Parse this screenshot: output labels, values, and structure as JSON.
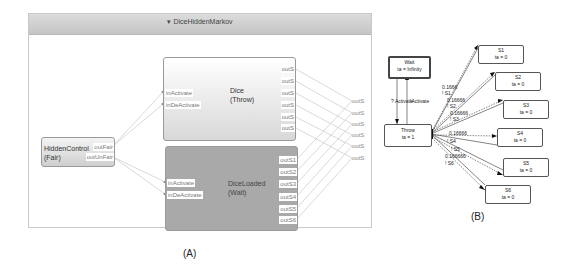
{
  "panel_a": {
    "caption": "(A)",
    "frame": {
      "title": "▾ DiceHiddenMarkov"
    },
    "blocks": {
      "dice": {
        "name": "Dice",
        "subtitle": "(Throw)",
        "inputs": [
          "inActivate",
          "inDeActivate"
        ],
        "outputs": [
          "outS",
          "outS",
          "outS",
          "outS",
          "outS",
          "outS"
        ]
      },
      "dice_loaded": {
        "name": "DiceLoaded",
        "subtitle": "(Wait)",
        "inputs": [
          "inActivate",
          "inDeActivate"
        ],
        "outputs": [
          "outS1",
          "outS2",
          "outS3",
          "outS4",
          "outS5",
          "outS6"
        ]
      },
      "hidden_control": {
        "name": "HiddenControl",
        "subtitle": "(Fair)",
        "outputs": [
          "outFair",
          "outUnFair"
        ]
      }
    },
    "external_outputs": [
      "outS",
      "outS",
      "outS",
      "outS",
      "outS",
      "outS"
    ]
  },
  "panel_b": {
    "caption": "(B)",
    "states": {
      "wait": {
        "name": "Wait",
        "ta": "ta = Infinity"
      },
      "throw": {
        "name": "Throw",
        "ta": "ta = 1"
      },
      "s": [
        {
          "name": "S1",
          "ta": "ta = 0"
        },
        {
          "name": "S2",
          "ta": "ta = 0"
        },
        {
          "name": "S3",
          "ta": "ta = 0"
        },
        {
          "name": "S4",
          "ta": "ta = 0"
        },
        {
          "name": "S5",
          "ta": "ta = 0"
        },
        {
          "name": "S6",
          "ta": "ta = 0"
        }
      ]
    },
    "edge_labels": {
      "activate": "? Activate",
      "activate_out": "!Activate",
      "p1": "0.1666",
      "o1": "! S1",
      "p2": "0.16666",
      "o2": "! S2",
      "p3": "0.16666",
      "o3": "! S3",
      "p4": "0.16666",
      "o4": "! S4",
      "o5": "! S5",
      "p6": "0.166666",
      "o6": "! S6"
    }
  }
}
